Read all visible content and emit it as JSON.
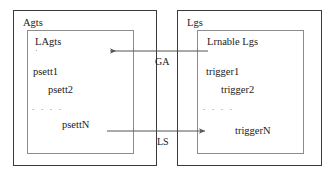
{
  "diagram": {
    "left_group": {
      "label": "Agts",
      "inner": {
        "label": "LAgts",
        "items": [
          {
            "text": "psett1",
            "indent": 0
          },
          {
            "text": "psett2",
            "indent": 1
          },
          {
            "text": ". . . .",
            "indent": 0
          },
          {
            "text": "psettN",
            "indent": 2
          }
        ]
      }
    },
    "right_group": {
      "label": "Lgs",
      "inner": {
        "label": "Lrnable Lgs",
        "items": [
          {
            "text": "trigger1",
            "indent": 0
          },
          {
            "text": "trigger2",
            "indent": 1
          },
          {
            "text": ". . . .",
            "indent": 0
          },
          {
            "text": "triggerN",
            "indent": 2
          }
        ]
      }
    },
    "arrows": [
      {
        "label": "GA",
        "direction": "left",
        "from": "Lrnable Lgs",
        "to": "LAgts"
      },
      {
        "label": "LS",
        "direction": "right",
        "from": "LAgts",
        "to": "Lrnable Lgs"
      }
    ],
    "colors": {
      "outer_border": "#3a3a3a",
      "inner_border": "#8c8c8c",
      "arrow": "#555555",
      "text": "#1a1a1a",
      "background": "#ffffff"
    }
  }
}
